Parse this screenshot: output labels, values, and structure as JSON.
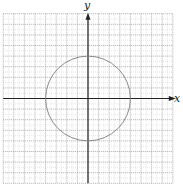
{
  "chart_data": {
    "type": "line",
    "title": "",
    "xlabel": "x",
    "ylabel": "y",
    "xlim": [
      -8,
      8
    ],
    "ylim": [
      -8,
      8
    ],
    "grid": true,
    "tick_labels": false,
    "series": [
      {
        "name": "circle",
        "shape": "circle",
        "center": [
          0,
          0
        ],
        "radius": 4,
        "equation": "x^2 + y^2 = 16"
      }
    ]
  },
  "axes": {
    "x_label": "x",
    "y_label": "y"
  },
  "colors": {
    "grid": "#9a9a9a",
    "axis": "#222222",
    "curve": "#8a8a8a"
  }
}
